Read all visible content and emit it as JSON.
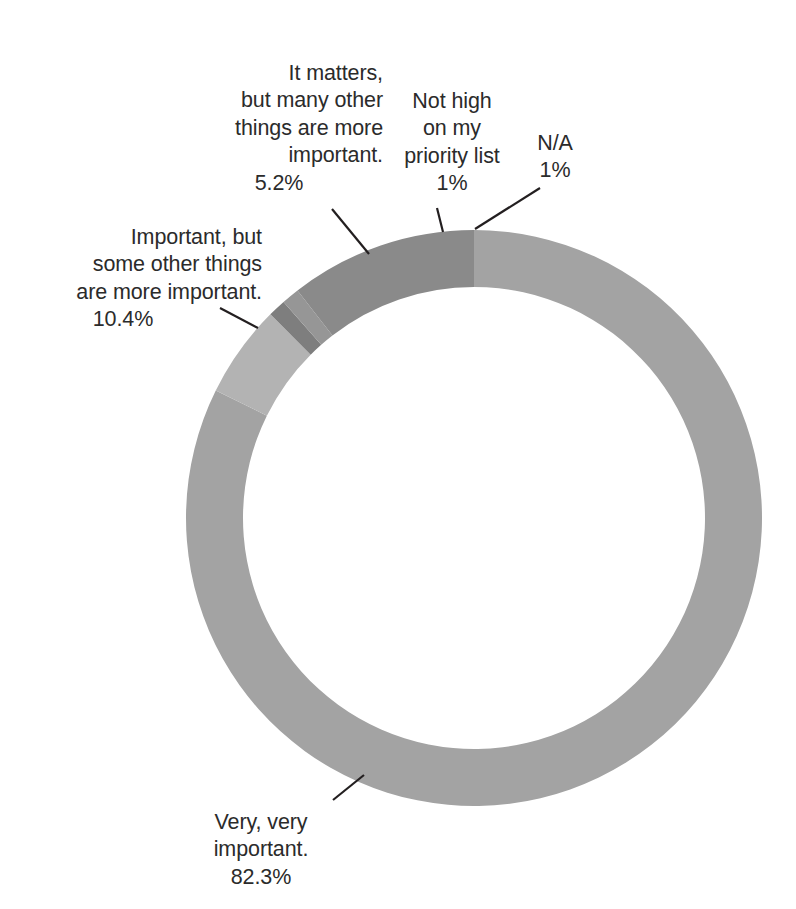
{
  "chart_data": {
    "type": "pie",
    "variant": "donut",
    "title": "",
    "subtitle": "",
    "xlabel": "",
    "ylabel": "",
    "legend": "none",
    "grid": false,
    "units": "percent",
    "total": 100,
    "center": {
      "x": 474,
      "y": 518
    },
    "outer_radius": 288,
    "inner_radius": 231,
    "start_angle_deg": 0,
    "direction": "clockwise",
    "categories": [
      "Very, very important.",
      "It matters, but many other things are more important.",
      "Not high on my priority list",
      "N/A",
      "Important, but some other things are more important."
    ],
    "values": [
      82.3,
      5.2,
      1,
      1,
      10.4
    ],
    "value_labels": [
      "82.3%",
      "5.2%",
      "1%",
      "1%",
      "10.4%"
    ],
    "colors": [
      "#a3a3a3",
      "#b3b3b3",
      "#7e7e7e",
      "#969696",
      "#8a8a8a"
    ],
    "slices": [
      {
        "name": "Very, very important.",
        "value": 82.3,
        "value_label": "82.3%",
        "color": "#a3a3a3",
        "start_deg": 0,
        "end_deg": 296.28
      },
      {
        "name": "It matters, but many other things are more important.",
        "value": 5.2,
        "value_label": "5.2%",
        "color": "#b3b3b3",
        "start_deg": 296.28,
        "end_deg": 315.0
      },
      {
        "name": "Not high on my priority list",
        "value": 1,
        "value_label": "1%",
        "color": "#7e7e7e",
        "start_deg": 315.0,
        "end_deg": 318.6
      },
      {
        "name": "N/A",
        "value": 1,
        "value_label": "1%",
        "color": "#969696",
        "start_deg": 318.6,
        "end_deg": 322.2
      },
      {
        "name": "Important, but some other things are more important.",
        "value": 10.4,
        "value_label": "10.4%",
        "color": "#8a8a8a",
        "start_deg": 322.2,
        "end_deg": 360.0
      }
    ]
  },
  "labels": {
    "it_matters": {
      "text": "It matters,\nbut many other\nthings are more\nimportant.",
      "percent": "5.2%"
    },
    "not_high": {
      "text": "Not high\non my\npriority list",
      "percent": "1%"
    },
    "na": {
      "text": "N/A",
      "percent": "1%"
    },
    "important_but": {
      "text": "Important, but\nsome other things\nare more important.",
      "percent": "10.4%"
    },
    "very_very": {
      "text": "Very, very\nimportant.",
      "percent": "82.3%"
    }
  },
  "leader_lines": {
    "it_matters": {
      "x1": 332,
      "y1": 209,
      "x2": 369,
      "y2": 254
    },
    "not_high": {
      "x1": 437,
      "y1": 208,
      "x2": 443,
      "y2": 232
    },
    "na": {
      "x1": 540,
      "y1": 188,
      "x2": 475,
      "y2": 229
    },
    "important_but": {
      "x1": 220,
      "y1": 308,
      "x2": 258,
      "y2": 328
    },
    "very_very": {
      "x1": 333,
      "y1": 800,
      "x2": 364,
      "y2": 775
    }
  },
  "page": {
    "background": "#ffffff",
    "text_color": "#2b2b2b",
    "line_color": "#231f20"
  }
}
